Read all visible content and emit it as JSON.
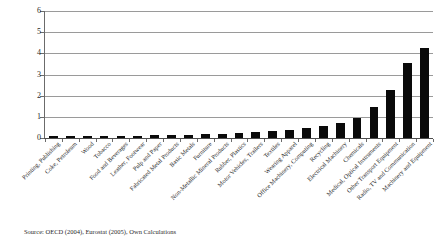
{
  "chart_data": {
    "type": "bar",
    "title": "",
    "xlabel": "",
    "ylabel": "",
    "ylim": [
      0,
      6
    ],
    "yticks": [
      0,
      1,
      2,
      3,
      4,
      5,
      6
    ],
    "ytick_labels": [
      "0",
      "1",
      "2",
      "3",
      "4",
      "5",
      "6"
    ],
    "grid": true,
    "legend": "none",
    "bar_color": "#0a0a0a",
    "categories": [
      "Printing, Publishing",
      "Coke, Petroleum",
      "Wood",
      "Tobacco",
      "Food and Beverages",
      "Leather, Footwear",
      "Pulp and Paper",
      "Fabricated Metal Products",
      "Basic Metals",
      "Furniture",
      "Non-Metallic Mineral Products",
      "Rubber, Plastics",
      "Motor Vehicles, Trailers",
      "Textiles",
      "Wearing Apparel",
      "Office Machinery, Computing",
      "Recycling",
      "Electrical Machinery",
      "Chemicals",
      "Medical, Optical Instruments",
      "Other Transport Equipment",
      "Radio, TV and Communication",
      "Machinery and Equipment"
    ],
    "values": [
      0.06,
      0.07,
      0.08,
      0.09,
      0.1,
      0.11,
      0.12,
      0.13,
      0.15,
      0.17,
      0.2,
      0.24,
      0.28,
      0.33,
      0.4,
      0.48,
      0.55,
      0.72,
      0.95,
      1.45,
      2.25,
      3.55,
      4.25
    ]
  },
  "source": {
    "note": "Source: OECD (2004), Eurostat (2005), Own Calculations"
  }
}
